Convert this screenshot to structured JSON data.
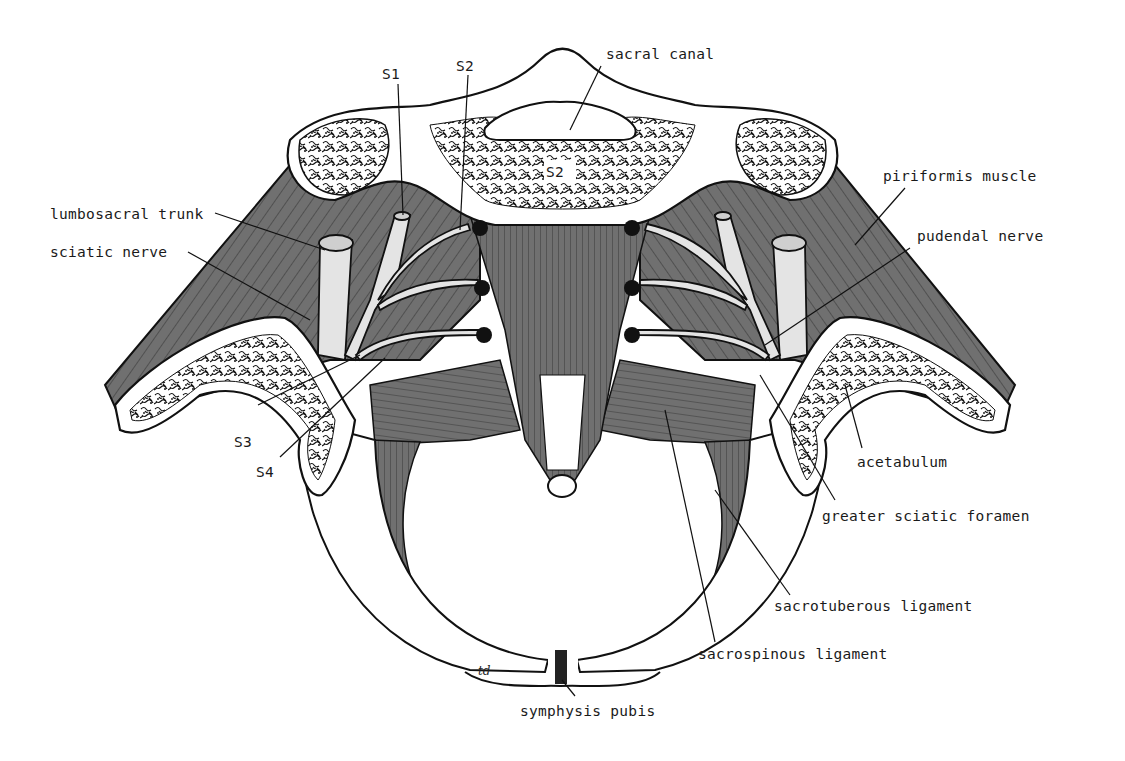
{
  "figure": {
    "colors": {
      "muscle": "#707070",
      "bone": "#ffffff",
      "nerve": "#e4e4e4",
      "outline": "#111111",
      "background": "#ffffff"
    },
    "signature": "td"
  },
  "labels": {
    "sacral_canal": "sacral canal",
    "s1": "S1",
    "s2_top": "S2",
    "s2_body": "S2",
    "lumbosacral_trunk": "lumbosacral trunk",
    "sciatic_nerve": "sciatic nerve",
    "piriformis_muscle": "piriformis muscle",
    "pudendal_nerve": "pudendal nerve",
    "s3": "S3",
    "s4": "S4",
    "acetabulum": "acetabulum",
    "greater_sciatic_foramen": "greater sciatic foramen",
    "sacrotuberous_ligament": "sacrotuberous ligament",
    "sacrospinous_ligament": "sacrospinous ligament",
    "symphysis_pubis": "symphysis pubis"
  }
}
